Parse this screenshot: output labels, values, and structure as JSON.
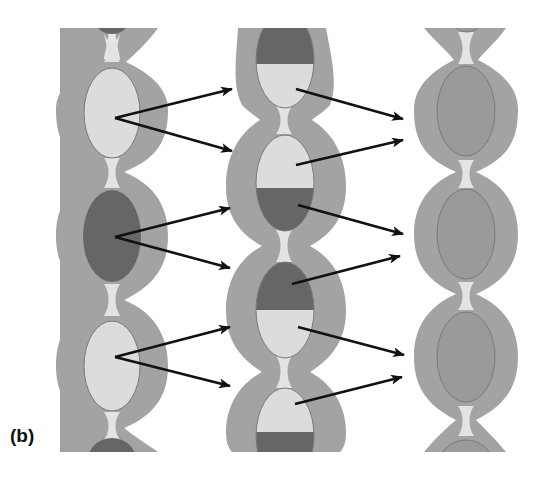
{
  "figure": {
    "panel_label": "(b)",
    "colors": {
      "background": "#ffffff",
      "outer_band": "#a3a3a3",
      "outer_band_stroke": "#8c8c8c",
      "neck_fill": "#e6e6e6",
      "light_cell": "#dcdcdc",
      "dark_cell": "#666666",
      "mixed_cell": "#9a9a9a",
      "cell_stroke": "#7a7a7a",
      "arrow": "#111111"
    },
    "columns": [
      {
        "name": "left-column",
        "description": "Parent strand with alternating light and dark segments",
        "cells": [
          {
            "position": "top-partial",
            "type": "dark"
          },
          {
            "position": 1,
            "type": "light"
          },
          {
            "position": 2,
            "type": "dark"
          },
          {
            "position": 3,
            "type": "light"
          },
          {
            "position": "bottom-partial",
            "type": "dark"
          }
        ]
      },
      {
        "name": "middle-column",
        "description": "Intermediate strand with half-light / half-dark segments",
        "cells": [
          {
            "position": 1,
            "type": "dark-top/light-bottom"
          },
          {
            "position": 2,
            "type": "light-top/dark-bottom"
          },
          {
            "position": 3,
            "type": "dark-top/light-bottom"
          },
          {
            "position": 4,
            "type": "light-top/dark-bottom"
          }
        ]
      },
      {
        "name": "right-column",
        "description": "Resulting strand with uniform medium-gray segments",
        "cells": [
          {
            "position": "top-partial",
            "type": "medium"
          },
          {
            "position": 1,
            "type": "medium"
          },
          {
            "position": 2,
            "type": "medium"
          },
          {
            "position": 3,
            "type": "medium"
          },
          {
            "position": "bottom-partial",
            "type": "medium"
          }
        ]
      }
    ],
    "arrows": {
      "left_to_middle": 6,
      "middle_to_right": 8
    }
  }
}
